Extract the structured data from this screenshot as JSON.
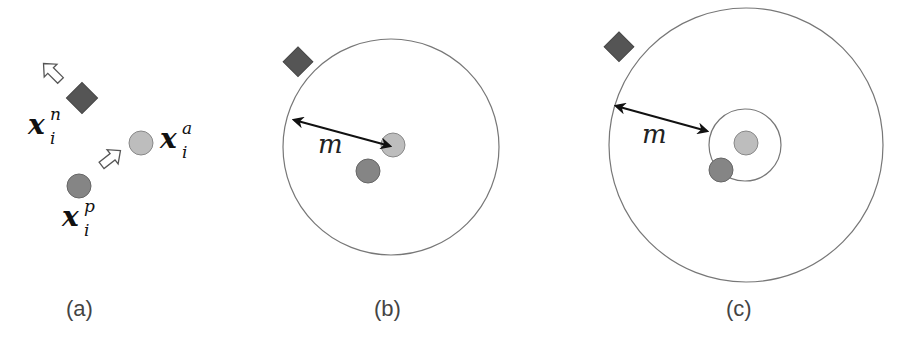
{
  "figure": {
    "panels": [
      {
        "id": "a",
        "caption": "(a)"
      },
      {
        "id": "b",
        "caption": "(b)"
      },
      {
        "id": "c",
        "caption": "(c)"
      }
    ],
    "labels": {
      "negative": {
        "base": "x",
        "sup": "n",
        "sub": "i"
      },
      "anchor": {
        "base": "x",
        "sup": "a",
        "sub": "i"
      },
      "positive": {
        "base": "x",
        "sup": "p",
        "sub": "i"
      },
      "margin_b": "m",
      "margin_c": "m"
    },
    "colors": {
      "negative_diamond": "#555555",
      "anchor_circle": "#bdbdbd",
      "positive_circle": "#858585",
      "outline": "#777777"
    }
  }
}
